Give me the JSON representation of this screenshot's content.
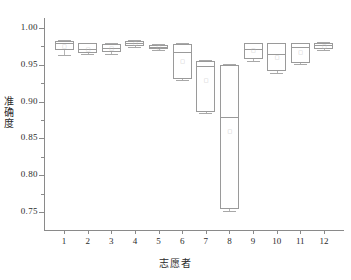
{
  "chart_data": {
    "type": "box",
    "title": "",
    "xlabel": "志愿者",
    "ylabel": "准确度",
    "categories": [
      "1",
      "2",
      "3",
      "4",
      "5",
      "6",
      "7",
      "8",
      "9",
      "10",
      "11",
      "12"
    ],
    "yticks": [
      "0.75",
      "0.80",
      "0.85",
      "0.90",
      "0.95",
      "1.00"
    ],
    "ylim": [
      0.735,
      1.012
    ],
    "ytick_values": [
      0.75,
      0.8,
      0.85,
      0.9,
      0.95,
      1.0
    ],
    "grid": false,
    "legend": null,
    "boxes": [
      {
        "category": "1",
        "whisker_low": 0.9635,
        "q1": 0.97,
        "median": 0.979,
        "q3": 0.983,
        "whisker_high": 0.984,
        "mean": 0.9762
      },
      {
        "category": "2",
        "whisker_low": 0.964,
        "q1": 0.9655,
        "median": 0.9715,
        "q3": 0.979,
        "whisker_high": 0.98,
        "mean": 0.9718
      },
      {
        "category": "3",
        "whisker_low": 0.964,
        "q1": 0.967,
        "median": 0.973,
        "q3": 0.9785,
        "whisker_high": 0.98,
        "mean": 0.9724
      },
      {
        "category": "4",
        "whisker_low": 0.9745,
        "q1": 0.9755,
        "median": 0.979,
        "q3": 0.983,
        "whisker_high": 0.984,
        "mean": 0.979
      },
      {
        "category": "5",
        "whisker_low": 0.9705,
        "q1": 0.9715,
        "median": 0.9745,
        "q3": 0.977,
        "whisker_high": 0.978,
        "mean": 0.9744
      },
      {
        "category": "6",
        "whisker_low": 0.93,
        "q1": 0.931,
        "median": 0.9675,
        "q3": 0.978,
        "whisker_high": 0.98,
        "mean": 0.9545
      },
      {
        "category": "7",
        "whisker_low": 0.8845,
        "q1": 0.886,
        "median": 0.949,
        "q3": 0.9555,
        "whisker_high": 0.957,
        "mean": 0.929
      },
      {
        "category": "8",
        "whisker_low": 0.752,
        "q1": 0.754,
        "median": 0.879,
        "q3": 0.9495,
        "whisker_high": 0.951,
        "mean": 0.86
      },
      {
        "category": "9",
        "whisker_low": 0.9555,
        "q1": 0.9575,
        "median": 0.9715,
        "q3": 0.979,
        "whisker_high": 0.98,
        "mean": 0.97
      },
      {
        "category": "10",
        "whisker_low": 0.9395,
        "q1": 0.941,
        "median": 0.9645,
        "q3": 0.979,
        "whisker_high": 0.98,
        "mean": 0.961
      },
      {
        "category": "11",
        "whisker_low": 0.951,
        "q1": 0.953,
        "median": 0.9745,
        "q3": 0.979,
        "whisker_high": 0.98,
        "mean": 0.968
      },
      {
        "category": "12",
        "whisker_low": 0.9695,
        "q1": 0.9715,
        "median": 0.9765,
        "q3": 0.98,
        "whisker_high": 0.981,
        "mean": 0.9758
      }
    ]
  },
  "axes": {
    "y_title": "准确度",
    "x_title": "志愿者"
  },
  "colors": {
    "axis": "#8a8a8a",
    "box_stroke": "#9a9a9a",
    "whisker": "#b5b5b5",
    "text": "#2b2b2b",
    "background": "#ffffff"
  }
}
